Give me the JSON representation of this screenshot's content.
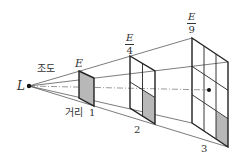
{
  "diagram": {
    "source_label": "L",
    "illuminance_label": "조도",
    "distance_label": "거리",
    "panels": [
      {
        "distance": "1",
        "illuminance": "E",
        "shaded_cells": 1,
        "grid": "1x1"
      },
      {
        "distance": "2",
        "illuminance_num": "E",
        "illuminance_den": "4",
        "shaded_cells": 1,
        "grid": "2x2"
      },
      {
        "distance": "3",
        "illuminance_num": "E",
        "illuminance_den": "9",
        "shaded_cells": 1,
        "grid": "3x3"
      }
    ],
    "colors": {
      "line": "#222222",
      "shade": "#b8b8b8"
    }
  }
}
